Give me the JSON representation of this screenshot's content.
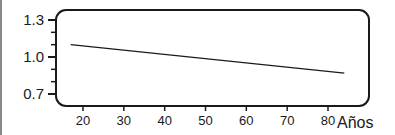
{
  "chart_data": {
    "type": "line",
    "title": "",
    "xlabel": "Años",
    "ylabel": "",
    "xlim": [
      15,
      85
    ],
    "ylim": [
      0.7,
      1.3
    ],
    "x_ticks": [
      20,
      30,
      40,
      50,
      60,
      70,
      80
    ],
    "x_tick_labels": [
      "20",
      "30",
      "40",
      "50",
      "60",
      "70",
      "80"
    ],
    "y_ticks": [
      0.7,
      1.0,
      1.3
    ],
    "y_tick_labels": [
      "0.7",
      "1.0",
      "1.3"
    ],
    "y_minor_ticks": [
      0.8,
      0.9,
      1.1,
      1.2
    ],
    "grid": false,
    "legend": null,
    "series": [
      {
        "name": "",
        "x": [
          17,
          84
        ],
        "y": [
          1.1,
          0.87
        ]
      }
    ]
  },
  "colors": {
    "axis": "#1a1a1a",
    "line": "#1a1a1a",
    "background": "#ffffff"
  }
}
